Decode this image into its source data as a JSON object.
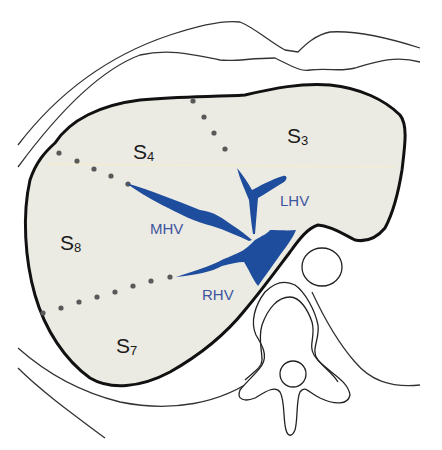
{
  "diagram": {
    "type": "anatomical-cross-section",
    "colors": {
      "liver_fill": "#ecebe3",
      "outline": "#111111",
      "vein": "#1e4d9e",
      "vein_label": "#3d559e",
      "boundary_dots": "#595959",
      "background": "#ffffff"
    },
    "segments": [
      {
        "letter": "S",
        "sub": "4"
      },
      {
        "letter": "S",
        "sub": "3"
      },
      {
        "letter": "S",
        "sub": "8"
      },
      {
        "letter": "S",
        "sub": "7"
      }
    ],
    "veins": [
      {
        "label": "LHV"
      },
      {
        "label": "MHV"
      },
      {
        "label": "RHV"
      }
    ]
  }
}
